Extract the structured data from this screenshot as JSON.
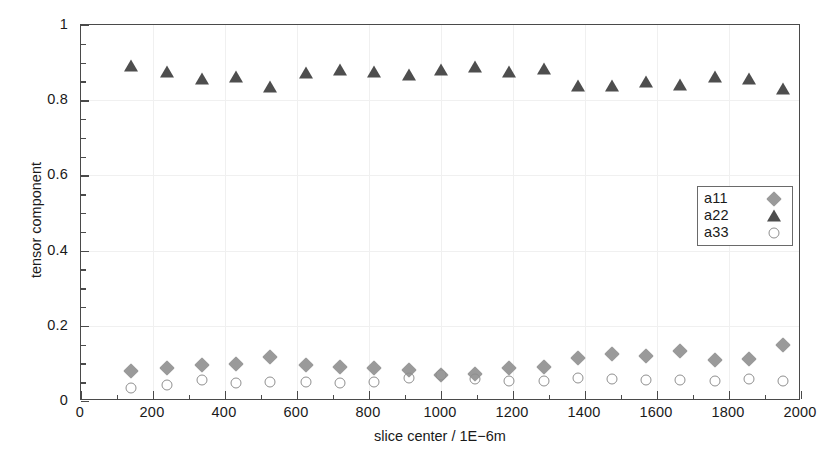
{
  "chart_data": {
    "type": "scatter",
    "title": "",
    "xlabel": "slice center / 1E−6m",
    "ylabel": "tensor component",
    "xlim": [
      0,
      2000
    ],
    "ylim": [
      0,
      1
    ],
    "xticks": [
      0,
      200,
      400,
      600,
      800,
      1000,
      1200,
      1400,
      1600,
      1800,
      2000
    ],
    "xticklabels": [
      "0",
      "200",
      "400",
      "600",
      "800",
      "1000",
      "1200",
      "1400",
      "1600",
      "1800",
      "2000"
    ],
    "yticks": [
      0,
      0.2,
      0.4,
      0.6,
      0.8,
      1
    ],
    "yticklabels": [
      "0",
      "0.2",
      "0.4",
      "0.6",
      "0.8",
      "1"
    ],
    "x_minor_tick_interval": 100,
    "y_minor_tick_interval": 0.05,
    "grid": "faint-major",
    "legend_position": "center-right",
    "x": [
      140,
      240,
      335,
      430,
      525,
      625,
      720,
      815,
      910,
      1000,
      1095,
      1190,
      1285,
      1380,
      1475,
      1570,
      1665,
      1760,
      1855,
      1950
    ],
    "series": [
      {
        "name": "a11",
        "marker": "diamond",
        "color": "#9a9a9a",
        "values": [
          0.08,
          0.088,
          0.095,
          0.098,
          0.118,
          0.095,
          0.09,
          0.088,
          0.083,
          0.07,
          0.072,
          0.088,
          0.09,
          0.115,
          0.125,
          0.12,
          0.132,
          0.11,
          0.112,
          0.148
        ]
      },
      {
        "name": "a22",
        "marker": "triangle",
        "color": "#4e4e4e",
        "values": [
          0.89,
          0.876,
          0.857,
          0.862,
          0.836,
          0.872,
          0.88,
          0.876,
          0.866,
          0.879,
          0.888,
          0.874,
          0.882,
          0.838,
          0.838,
          0.849,
          0.84,
          0.861,
          0.857,
          0.829
        ]
      },
      {
        "name": "a33",
        "marker": "circle",
        "color": "#8f8f8f",
        "values": [
          0.035,
          0.042,
          0.057,
          0.048,
          0.05,
          0.05,
          0.048,
          0.05,
          0.062,
          0.068,
          0.058,
          0.052,
          0.052,
          0.062,
          0.058,
          0.055,
          0.055,
          0.052,
          0.058,
          0.052
        ]
      }
    ],
    "legend": [
      {
        "label": "a11",
        "marker": "diamond"
      },
      {
        "label": "a22",
        "marker": "triangle"
      },
      {
        "label": "a33",
        "marker": "circle"
      }
    ]
  }
}
